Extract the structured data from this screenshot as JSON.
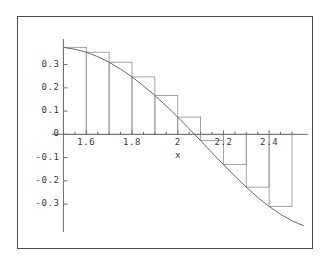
{
  "figure": {
    "border_color": "#4a4a4a",
    "background": "#ffffff",
    "axis_color": "#6b6b6b",
    "curve_color": "#6b6b6b",
    "rect_color": "#9a9a9a"
  },
  "axes": {
    "x_title": "x",
    "y_title": ""
  },
  "chart_data": {
    "type": "area",
    "title": "",
    "subtitle": "",
    "xlabel": "x",
    "ylabel": "",
    "grid": false,
    "legend": null,
    "xlim": [
      1.45,
      2.57
    ],
    "ylim": [
      -0.42,
      0.41
    ],
    "x_ticks": [
      1.6,
      1.8,
      2,
      2.2,
      2.4
    ],
    "x_tick_labels": [
      "1.6",
      "1.8",
      "2",
      "2.2",
      "2.4"
    ],
    "x_minor_ticks": [
      1.5,
      1.55,
      1.65,
      1.7,
      1.75,
      1.85,
      1.9,
      1.95,
      2.05,
      2.1,
      2.15,
      2.25,
      2.3,
      2.35,
      2.45,
      2.5
    ],
    "y_ticks": [
      0.3,
      0.2,
      0.1,
      0,
      -0.1,
      -0.2,
      -0.3
    ],
    "y_tick_labels": [
      "0.3",
      "0.2",
      "0.1",
      "0",
      "-0.1",
      "-0.2",
      "-0.3"
    ],
    "curve": {
      "name": "f(x)",
      "description": "smooth decreasing curve crossing zero near x = 2",
      "x": [
        1.5,
        1.55,
        1.6,
        1.65,
        1.7,
        1.75,
        1.8,
        1.85,
        1.9,
        1.95,
        2.0,
        2.05,
        2.1,
        2.15,
        2.2,
        2.25,
        2.3,
        2.35,
        2.4,
        2.45,
        2.5,
        2.55
      ],
      "y": [
        0.374,
        0.366,
        0.353,
        0.334,
        0.31,
        0.281,
        0.247,
        0.209,
        0.167,
        0.122,
        0.074,
        0.024,
        -0.027,
        -0.079,
        -0.13,
        -0.18,
        -0.227,
        -0.271,
        -0.31,
        -0.344,
        -0.372,
        -0.393
      ]
    },
    "rectangles": {
      "method": "left Riemann sum",
      "width": 0.1,
      "left_edges": [
        1.5,
        1.6,
        1.7,
        1.8,
        1.9,
        2.0,
        2.1,
        2.2,
        2.3,
        2.4
      ],
      "heights": [
        0.374,
        0.353,
        0.31,
        0.247,
        0.167,
        0.074,
        -0.027,
        -0.13,
        -0.227,
        -0.31
      ]
    }
  }
}
